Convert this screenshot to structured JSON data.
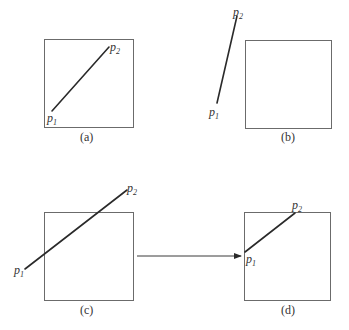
{
  "figure": {
    "panels": [
      {
        "id": "a",
        "caption": "(a)",
        "description": "Line segment fully inside the clipping window",
        "p1_label": "p",
        "p1_sub": "1",
        "p2_label": "p",
        "p2_sub": "2"
      },
      {
        "id": "b",
        "caption": "(b)",
        "description": "Line segment fully outside the clipping window",
        "p1_label": "p",
        "p1_sub": "1",
        "p2_label": "p",
        "p2_sub": "2"
      },
      {
        "id": "c",
        "caption": "(c)",
        "description": "Line segment crossing the clipping window",
        "p1_label": "p",
        "p1_sub": "1",
        "p2_label": "p",
        "p2_sub": "2"
      },
      {
        "id": "d",
        "caption": "(d)",
        "description": "Clipped line segment after clipping",
        "p1_label": "p",
        "p1_sub": "1",
        "p2_label": "p",
        "p2_sub": "2"
      }
    ],
    "arrow": {
      "from": "c",
      "to": "d"
    },
    "colors": {
      "stroke": "#2a2a2a",
      "box": "#6b6b6b",
      "text": "#333333",
      "background": "#ffffff"
    }
  }
}
